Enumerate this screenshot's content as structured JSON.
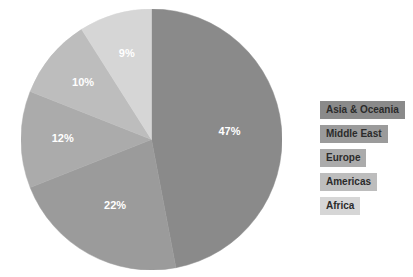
{
  "chart_data": {
    "type": "pie",
    "title": "",
    "subtitle": "",
    "xlabel": "",
    "ylabel": "",
    "grid": false,
    "legend_position": "right",
    "units": "percent",
    "start_angle_deg": 0,
    "direction": "clockwise",
    "categories": [
      "Asia & Oceania",
      "Middle East",
      "Europe",
      "Americas",
      "Africa"
    ],
    "values": [
      47,
      22,
      12,
      10,
      9
    ],
    "labels": [
      "47%",
      "22%",
      "12%",
      "10%",
      "9%"
    ],
    "colors": [
      "#8a8a8a",
      "#9b9b9b",
      "#ababab",
      "#bdbdbd",
      "#d6d6d6"
    ],
    "slices": [
      {
        "name": "Asia & Oceania",
        "value": 47,
        "label": "47%",
        "color": "#8a8a8a",
        "label_color": "#ffffff"
      },
      {
        "name": "Middle East",
        "value": 22,
        "label": "22%",
        "color": "#9b9b9b",
        "label_color": "#ffffff"
      },
      {
        "name": "Europe",
        "value": 12,
        "label": "12%",
        "color": "#ababab",
        "label_color": "#ffffff"
      },
      {
        "name": "Americas",
        "value": 10,
        "label": "10%",
        "color": "#bdbdbd",
        "label_color": "#ffffff"
      },
      {
        "name": "Africa",
        "value": 9,
        "label": "9%",
        "color": "#d6d6d6",
        "label_color": "#ffffff"
      }
    ]
  },
  "legend": {
    "items": [
      {
        "label": "Asia & Oceania",
        "swatch_color": "#8a8a8a"
      },
      {
        "label": "Middle East",
        "swatch_color": "#9b9b9b"
      },
      {
        "label": "Europe",
        "swatch_color": "#ababab"
      },
      {
        "label": "Americas",
        "swatch_color": "#bdbdbd"
      },
      {
        "label": "Africa",
        "swatch_color": "#d6d6d6"
      }
    ]
  },
  "canvas": {
    "background": "#ffffff",
    "width": 413,
    "height": 277
  }
}
